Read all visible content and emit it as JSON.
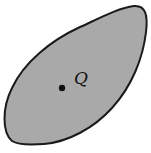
{
  "diagram": {
    "region": {
      "fill": "#a9a9a9",
      "stroke": "#1a1a1a"
    },
    "point": {
      "label": "Q",
      "color": "#111111"
    }
  }
}
